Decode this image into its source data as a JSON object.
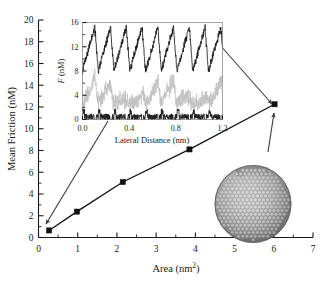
{
  "figure": {
    "name": "mean-friction-vs-area",
    "background_color": "#ffffff",
    "line_color": "#111111",
    "leader_color": "#3b3b3b",
    "particle_color": "#8e8e8e"
  },
  "chart_data": {
    "type": "line",
    "title": "",
    "xlabel": "Area (nm2)",
    "xlabel_base": "Area (nm",
    "xlabel_sup": "2",
    "xlabel_tail": ")",
    "ylabel": "Mean Friction (nM)",
    "xlim": [
      0,
      7
    ],
    "ylim": [
      0,
      20
    ],
    "xticks": [
      0,
      1,
      2,
      3,
      4,
      5,
      6,
      7
    ],
    "xticklabels": [
      "0",
      "1",
      "2",
      "3",
      "4",
      "5",
      "6",
      "7"
    ],
    "xminorticks": [
      0.5,
      1.5,
      2.5,
      3.5,
      4.5,
      5.5,
      6.5
    ],
    "yticks": [
      0,
      2,
      4,
      6,
      8,
      10,
      12,
      14,
      16,
      18,
      20
    ],
    "yticklabels": [
      "0",
      "2",
      "4",
      "6",
      "8",
      "10",
      "12",
      "14",
      "16",
      "18",
      "20"
    ],
    "yminorticks": [
      1,
      3,
      5,
      7,
      9,
      11,
      13,
      15,
      17,
      19
    ],
    "grid": false,
    "legend": false,
    "marker": "filled-square",
    "x": [
      0.27,
      0.98,
      2.15,
      3.85,
      6.02
    ],
    "y": [
      0.65,
      2.38,
      5.1,
      8.1,
      12.25
    ],
    "series": [
      {
        "name": "mean friction",
        "x": [
          0.27,
          0.98,
          2.15,
          3.85,
          6.02
        ],
        "values": [
          0.65,
          2.38,
          5.1,
          8.1,
          12.25
        ]
      }
    ]
  },
  "inset": {
    "name": "friction-trace-inset",
    "xlabel": "Lateral Distance (nm)",
    "ylabel": "F (nM)",
    "ylabel_italic": "F",
    "ylabel_unit": " (nM)",
    "xlim": [
      0.0,
      1.2
    ],
    "ylim": [
      0,
      16
    ],
    "xticks": [
      0.0,
      0.4,
      0.8,
      1.2
    ],
    "xticklabels": [
      "0.0",
      "0.4",
      "0.8",
      "1.2"
    ],
    "xminorticks": [
      0.2,
      0.6,
      1.0
    ],
    "yticks": [
      0,
      4,
      8,
      12,
      16
    ],
    "yticklabels": [
      "0",
      "4",
      "8",
      "12",
      "16"
    ],
    "yminorticks": [
      2,
      6,
      10,
      14
    ],
    "type": "line",
    "period_nm": 0.135,
    "traces": [
      {
        "name": "upper-sawtooth-dark",
        "color": "#1b1b1b",
        "baseline": 8.0,
        "amplitude": 7.2,
        "noise": 0.55
      },
      {
        "name": "middle-trace-light",
        "color": "#c2c2c2",
        "baseline": 2.6,
        "amplitude": 4.4,
        "noise": 0.9
      },
      {
        "name": "lower-trace-dark",
        "color": "#1b1b1b",
        "baseline": 0.45,
        "amplitude": 1.5,
        "noise": 0.5
      }
    ]
  },
  "annotations": {
    "arrow_inset_to_first_point": "arrow from inset lower-left to first data point",
    "arrow_inset_to_last_point": "arrow from inset right edge to last data point",
    "arrow_particle_to_last_point": "arrow from nanoparticle to last data point",
    "nanoparticle_label": "gold nanoparticle model"
  }
}
